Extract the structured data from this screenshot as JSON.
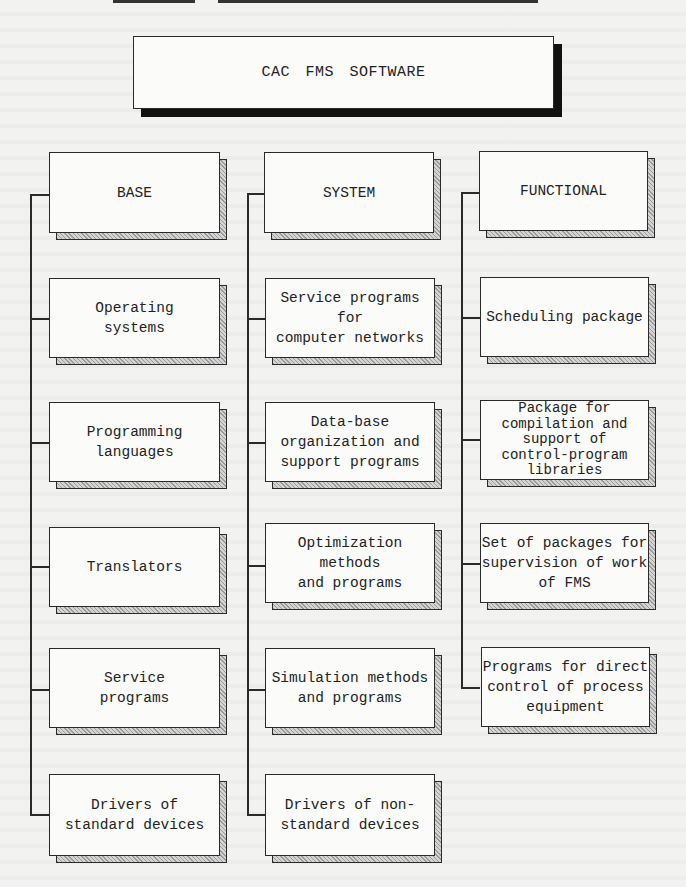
{
  "title": "CAC FMS SOFTWARE",
  "columns": [
    {
      "header": "BASE",
      "items": [
        "Operating\nsystems",
        "Programming\nlanguages",
        "Translators",
        "Service\nprograms",
        "Drivers of\nstandard devices"
      ]
    },
    {
      "header": "SYSTEM",
      "items": [
        "Service programs for\ncomputer networks",
        "Data-base\norganization and\nsupport programs",
        "Optimization methods\nand programs",
        "Simulation methods\nand programs",
        "Drivers of non-\nstandard devices"
      ]
    },
    {
      "header": "FUNCTIONAL",
      "items": [
        "Scheduling package",
        "Package for\ncompilation and\nsupport of\ncontrol-program\nlibraries",
        "Set of packages for\nsupervision of work\nof FMS",
        "Programs for direct\ncontrol of process\nequipment"
      ]
    }
  ]
}
